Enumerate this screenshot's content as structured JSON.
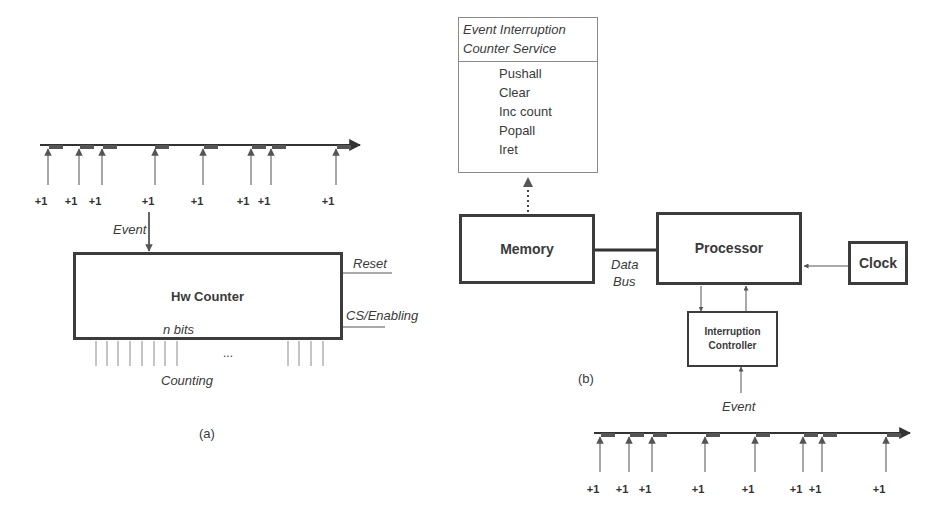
{
  "panel_a": {
    "caption": "(a)",
    "timeline": {
      "pulse_x": [
        47,
        79,
        102,
        154,
        203,
        251,
        271,
        336
      ],
      "pulse_labels": [
        "+1",
        "+1",
        "+1",
        "+1",
        "+1",
        "+1",
        "+1",
        "+1"
      ]
    },
    "event_label": "Event",
    "counter": {
      "title": "Hw Counter",
      "width_label": "n bits",
      "output_label": "Counting",
      "ellipsis": "...",
      "reset_label": "Reset",
      "enable_label": "CS/Enabling"
    }
  },
  "panel_b": {
    "caption": "(b)",
    "service": {
      "title_line1": "Event Interruption",
      "title_line2": "Counter Service",
      "steps": [
        "Pushall",
        "Clear",
        "Inc count",
        "Popall",
        "Iret"
      ]
    },
    "memory_label": "Memory",
    "processor_label": "Processor",
    "clock_label": "Clock",
    "bus_label_line1": "Data",
    "bus_label_line2": "Bus",
    "controller_line1": "Interruption",
    "controller_line2": "Controller",
    "event_label": "Event",
    "timeline": {
      "pulse_x": [
        600,
        629,
        652,
        705,
        755,
        803,
        822,
        886
      ],
      "pulse_labels": [
        "+1",
        "+1",
        "+1",
        "+1",
        "+1",
        "+1",
        "+1",
        "+1"
      ]
    }
  },
  "colors": {
    "line": "#3c3c3c",
    "pulse": "#8a8a8a",
    "pulse_block": "#555555"
  }
}
